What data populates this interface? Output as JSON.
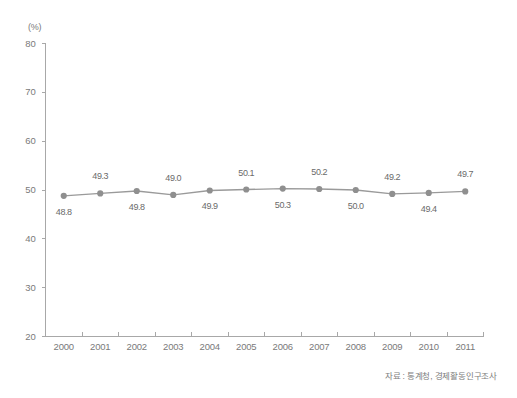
{
  "chart_data": {
    "type": "line",
    "title": "",
    "subtitle": "",
    "xlabel": "",
    "ylabel": "",
    "unit_label": "(%)",
    "categories": [
      "2000",
      "2001",
      "2002",
      "2003",
      "2004",
      "2005",
      "2006",
      "2007",
      "2008",
      "2009",
      "2010",
      "2011"
    ],
    "values": [
      48.8,
      49.3,
      49.8,
      49.0,
      49.9,
      50.1,
      50.3,
      50.2,
      50.0,
      49.2,
      49.4,
      49.7
    ],
    "point_labels": [
      "48.8",
      "49.3",
      "49.8",
      "49.0",
      "49.9",
      "50.1",
      "50.3",
      "50.2",
      "50.0",
      "49.2",
      "49.4",
      "49.7"
    ],
    "label_positions": [
      "below",
      "above",
      "below",
      "above",
      "below",
      "above",
      "below",
      "above",
      "below",
      "above",
      "below",
      "above"
    ],
    "ylim": [
      20,
      80
    ],
    "yticks": [
      20,
      30,
      40,
      50,
      60,
      70,
      80
    ],
    "ytick_labels": [
      "20",
      "30",
      "40",
      "50",
      "60",
      "70",
      "80"
    ],
    "grid": false,
    "legend": null,
    "series_color": "#9a9a9a",
    "marker_color": "#8f8f8f",
    "axis_color": "#a8a8a8",
    "text_color": "#6e6e6e"
  },
  "footer": {
    "source": "자료 : 통계청, 경제활동인구조사"
  }
}
